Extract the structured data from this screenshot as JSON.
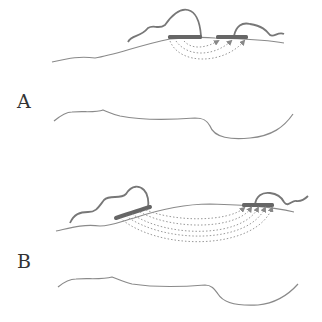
{
  "figure": {
    "panels": [
      {
        "label": "A",
        "description": "Short-range transfer between two adjacent patches"
      },
      {
        "label": "B",
        "description": "Long-range transfer between distant patches"
      }
    ],
    "colors": {
      "line": "#8a8a8a",
      "wave": "#777777",
      "block": "#666666",
      "dotted": "#999999",
      "label": "#333333"
    }
  }
}
